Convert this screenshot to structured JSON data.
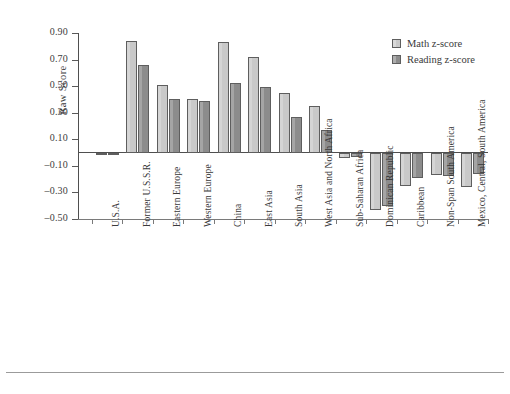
{
  "chart_data": {
    "type": "bar",
    "title": "",
    "xlabel": "",
    "ylabel": "Raw Score",
    "ylim": [
      -0.5,
      0.9
    ],
    "yticks": [
      0.9,
      0.7,
      0.5,
      0.3,
      0.1,
      -0.1,
      -0.3,
      -0.5
    ],
    "ytick_labels": [
      "0.90",
      "0.70",
      "0.50",
      "0.30",
      "0.10",
      "–0.10",
      "–0.30",
      "–0.50"
    ],
    "grid": false,
    "legend_position": "top-right",
    "categories": [
      "U.S.A.",
      "Former U.S.S.R.",
      "Eastern Europe",
      "Western Europe",
      "China",
      "East Asia",
      "South Asia",
      "West Asia and North Africa",
      "Sub-Saharan Africa",
      "Dominican Republic",
      "Caribbean",
      "Non-Span South America",
      "Mexico, Central, South America"
    ],
    "series": [
      {
        "name": "Math z-score",
        "color": "#c9c9c9",
        "values": [
          0.0,
          0.84,
          0.51,
          0.4,
          0.83,
          0.72,
          0.45,
          0.35,
          -0.04,
          -0.43,
          -0.25,
          -0.17,
          -0.26
        ]
      },
      {
        "name": "Reading z-score",
        "color": "#8c8c8c",
        "values": [
          0.0,
          0.66,
          0.4,
          0.39,
          0.52,
          0.49,
          0.27,
          0.17,
          -0.03,
          -0.4,
          -0.19,
          -0.18,
          -0.16
        ]
      }
    ]
  },
  "legend": {
    "items": [
      {
        "label": "Math z-score",
        "swatch": "math"
      },
      {
        "label": "Reading z-score",
        "swatch": "read"
      }
    ]
  }
}
